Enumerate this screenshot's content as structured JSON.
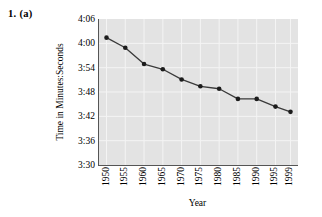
{
  "figure": {
    "problem_label": "1.  (a)"
  },
  "chart_data": {
    "type": "line",
    "title": "",
    "xlabel": "Year",
    "ylabel": "Time in Minutes:Seconds",
    "categories": [
      "1950",
      "1955",
      "1960",
      "1965",
      "1970",
      "1975",
      "1980",
      "1985",
      "1990",
      "1995",
      "1999"
    ],
    "x": [
      1950,
      1955,
      1960,
      1965,
      1970,
      1975,
      1980,
      1985,
      1990,
      1995,
      1999
    ],
    "values": [
      "4:01.4",
      "3:58.9",
      "3:54.9",
      "3:53.6",
      "3:51.1",
      "3:49.4",
      "3:48.8",
      "3:46.3",
      "3:46.3",
      "3:44.4",
      "3:43.1"
    ],
    "values_seconds": [
      241.4,
      238.9,
      234.9,
      233.6,
      231.1,
      229.4,
      228.8,
      226.3,
      226.3,
      224.4,
      223.1
    ],
    "ytick_labels": [
      "4:06",
      "4:00",
      "3:54",
      "3:48",
      "3:42",
      "3:36",
      "3:30"
    ],
    "ytick_seconds": [
      246,
      240,
      234,
      228,
      222,
      216,
      210
    ],
    "ylim_seconds": [
      210,
      246
    ],
    "xlim": [
      1948,
      2001
    ],
    "grid": true,
    "legend": "none",
    "marker": "circle",
    "series": [
      {
        "name": "World record mile time",
        "values_seconds": [
          241.4,
          238.9,
          234.9,
          233.6,
          231.1,
          229.4,
          228.8,
          226.3,
          226.3,
          224.4,
          223.1
        ]
      }
    ],
    "colors": {
      "plot_background": "#e3e3e3",
      "gridline": "#f4f4f4",
      "line": "#3a3a3a",
      "marker": "#1c1c1c",
      "axis": "#555555",
      "text": "#000000"
    }
  }
}
